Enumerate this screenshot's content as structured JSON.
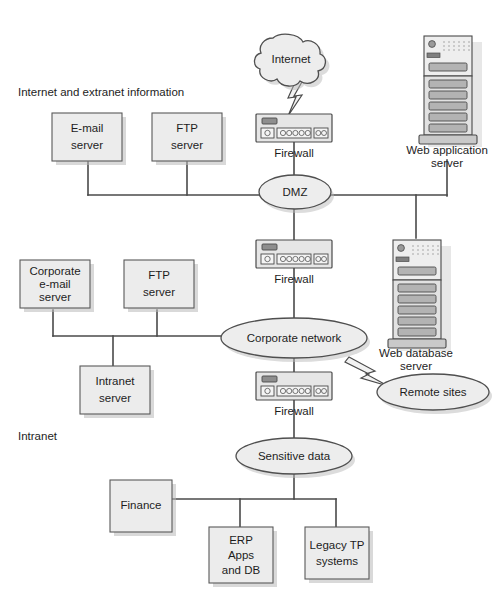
{
  "diagram": {
    "type": "network-topology",
    "colors": {
      "line": "#4a4a4a",
      "shape_fill": "#ececec",
      "shape_stroke": "#4f4f4f",
      "shadow": "#b9b9b9",
      "text": "#1d1d1d",
      "background": "#ffffff"
    },
    "zones": [
      {
        "id": "internet-extranet",
        "label": "Internet and extranet information"
      },
      {
        "id": "intranet",
        "label": "Intranet"
      }
    ],
    "clouds": [
      {
        "id": "internet",
        "label": "Internet",
        "icon": "cloud-icon"
      }
    ],
    "ellipses": [
      {
        "id": "dmz",
        "label": "DMZ"
      },
      {
        "id": "corporate-network",
        "label": "Corporate network"
      },
      {
        "id": "remote-sites",
        "label": "Remote sites"
      },
      {
        "id": "sensitive-data",
        "label": "Sensitive data"
      }
    ],
    "firewalls": [
      {
        "id": "firewall-top",
        "label": "Firewall",
        "icon": "firewall-icon"
      },
      {
        "id": "firewall-middle",
        "label": "Firewall",
        "icon": "firewall-icon"
      },
      {
        "id": "firewall-bottom",
        "label": "Firewall",
        "icon": "firewall-icon"
      }
    ],
    "towers": [
      {
        "id": "web-application-server",
        "label_line1": "Web application",
        "label_line2": "server",
        "icon": "server-tower-icon"
      },
      {
        "id": "web-database-server",
        "label_line1": "Web database",
        "label_line2": "server",
        "icon": "server-tower-icon"
      }
    ],
    "boxes": [
      {
        "id": "email-server",
        "lines": [
          "E-mail",
          "server"
        ]
      },
      {
        "id": "ftp-server-dmz",
        "lines": [
          "FTP",
          "server"
        ]
      },
      {
        "id": "corporate-email-server",
        "lines": [
          "Corporate",
          "e-mail",
          "server"
        ]
      },
      {
        "id": "ftp-server-intranet",
        "lines": [
          "FTP",
          "server"
        ]
      },
      {
        "id": "intranet-server",
        "lines": [
          "Intranet",
          "server"
        ]
      },
      {
        "id": "finance",
        "lines": [
          "Finance"
        ]
      },
      {
        "id": "erp-apps-and-db",
        "lines": [
          "ERP",
          "Apps",
          "and DB"
        ]
      },
      {
        "id": "legacy-tp-systems",
        "lines": [
          "Legacy TP",
          "systems"
        ]
      }
    ],
    "links": [
      {
        "from": "internet",
        "to": "firewall-top",
        "style": "lightning"
      },
      {
        "from": "firewall-top",
        "to": "dmz",
        "style": "line"
      },
      {
        "from": "email-server",
        "to": "dmz",
        "style": "bus"
      },
      {
        "from": "ftp-server-dmz",
        "to": "dmz",
        "style": "bus"
      },
      {
        "from": "web-application-server",
        "to": "dmz",
        "style": "bus"
      },
      {
        "from": "dmz",
        "to": "firewall-middle",
        "style": "line"
      },
      {
        "from": "web-database-server",
        "to": "dmz",
        "style": "bus"
      },
      {
        "from": "firewall-middle",
        "to": "corporate-network",
        "style": "line"
      },
      {
        "from": "corporate-email-server",
        "to": "corporate-network",
        "style": "bus"
      },
      {
        "from": "ftp-server-intranet",
        "to": "corporate-network",
        "style": "bus"
      },
      {
        "from": "intranet-server",
        "to": "corporate-network",
        "style": "bus"
      },
      {
        "from": "corporate-network",
        "to": "remote-sites",
        "style": "lightning"
      },
      {
        "from": "corporate-network",
        "to": "firewall-bottom",
        "style": "line"
      },
      {
        "from": "firewall-bottom",
        "to": "sensitive-data",
        "style": "line"
      },
      {
        "from": "sensitive-data",
        "to": "finance",
        "style": "bus"
      },
      {
        "from": "sensitive-data",
        "to": "erp-apps-and-db",
        "style": "bus"
      },
      {
        "from": "sensitive-data",
        "to": "legacy-tp-systems",
        "style": "bus"
      }
    ]
  }
}
